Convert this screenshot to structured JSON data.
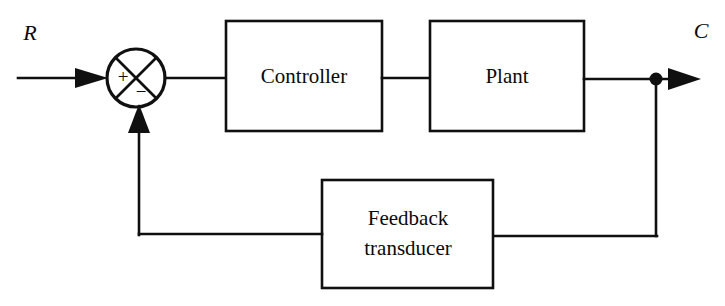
{
  "diagram": {
    "type": "block-diagram",
    "background_color": "#ffffff",
    "line_color": "#101010",
    "blocks": [
      {
        "id": "controller",
        "label": "Controller",
        "x": 226,
        "y": 21,
        "w": 156,
        "h": 110
      },
      {
        "id": "plant",
        "label": "Plant",
        "x": 430,
        "y": 21,
        "w": 154,
        "h": 110
      },
      {
        "id": "feedback",
        "label_line1": "Feedback",
        "label_line2": "transducer",
        "x": 322,
        "y": 180,
        "w": 171,
        "h": 108
      }
    ],
    "summing_junction": {
      "id": "summing-junction",
      "cx": 136,
      "cy": 78,
      "r": 29,
      "plus_sign": "+",
      "minus_sign": "−"
    },
    "signals": {
      "input_label": "R",
      "output_label": "C"
    },
    "takeoff_node": {
      "cx": 656,
      "cy": 80,
      "r": 6
    }
  }
}
